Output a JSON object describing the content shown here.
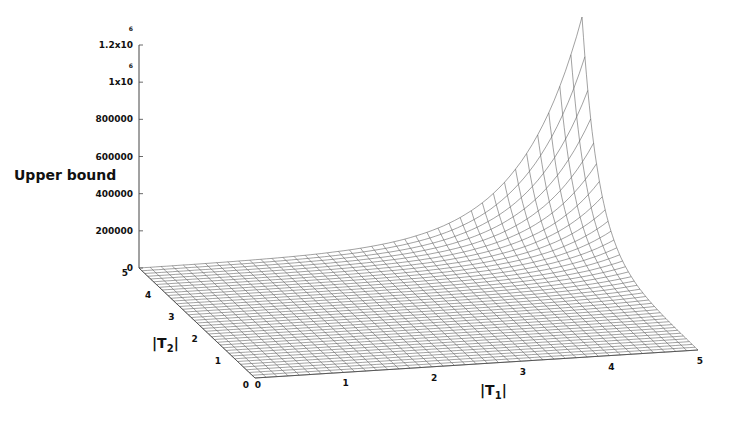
{
  "chart_data": {
    "type": "surface3d",
    "title": "",
    "zlabel": "Upper bound",
    "xlabel": "|T1|",
    "ylabel": "|T2|",
    "xlabel_main": "|T",
    "xlabel_sub": "1",
    "ylabel_main": "|T",
    "ylabel_sub": "2",
    "x_range": [
      0,
      5
    ],
    "y_range": [
      0,
      5
    ],
    "z_range": [
      0,
      1200000
    ],
    "x_ticks": [
      "0",
      "1",
      "2",
      "3",
      "4",
      "5"
    ],
    "y_ticks": [
      "0",
      "1",
      "2",
      "3",
      "4",
      "5"
    ],
    "z_ticks": [
      {
        "value": 0,
        "label": "0"
      },
      {
        "value": 200000,
        "label": "200000"
      },
      {
        "value": 400000,
        "label": "400000"
      },
      {
        "value": 600000,
        "label": "600000"
      },
      {
        "value": 800000,
        "label": "800000"
      },
      {
        "value": 1000000,
        "label": "1x10",
        "exp": "6"
      },
      {
        "value": 1200000,
        "label": "1.2x10",
        "exp": "6"
      }
    ],
    "surface": {
      "description": "Wireframe mesh, near zero over most of domain, rising sharply toward |T1|=5, |T2|=5",
      "grid_n": 40,
      "peak": {
        "x": 5,
        "y": 5,
        "z": 1200000
      },
      "corner_values": {
        "x0y0": 0,
        "x5y0": 0,
        "x0y5": 0,
        "x5y5": 1200000
      },
      "mesh_color": "#555555"
    },
    "grid": false,
    "legend": null
  }
}
